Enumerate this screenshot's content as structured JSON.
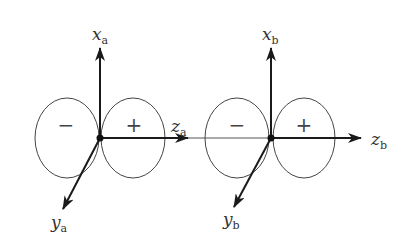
{
  "figure": {
    "diagrams": [
      {
        "id": "a",
        "origin": [
          100,
          138
        ],
        "x_axis": {
          "label": "x",
          "subscript": "a"
        },
        "y_axis": {
          "label": "y",
          "subscript": "a"
        },
        "z_axis": {
          "label": "z",
          "subscript": "a"
        },
        "lobes": [
          {
            "sign": "−",
            "position": "left"
          },
          {
            "sign": "+",
            "position": "right"
          }
        ]
      },
      {
        "id": "b",
        "origin": [
          271,
          138
        ],
        "x_axis": {
          "label": "x",
          "subscript": "b"
        },
        "y_axis": {
          "label": "y",
          "subscript": "b"
        },
        "z_axis": {
          "label": "z",
          "subscript": "b"
        },
        "lobes": [
          {
            "sign": "−",
            "position": "left"
          },
          {
            "sign": "+",
            "position": "right"
          }
        ]
      }
    ],
    "colors": {
      "stroke": "#222222",
      "thin": "#555555",
      "text": "#333333"
    }
  }
}
